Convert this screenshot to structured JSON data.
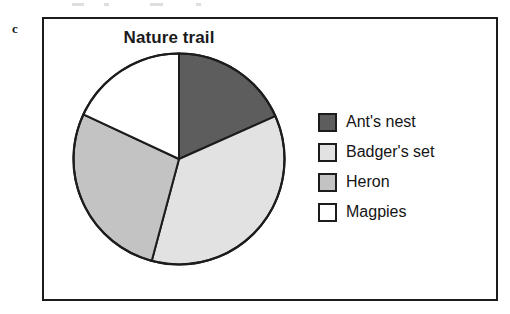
{
  "panel": {
    "letter": "c"
  },
  "chart_data": {
    "type": "pie",
    "title": "Nature trail",
    "xlabel": "",
    "ylabel": "",
    "legend_position": "right",
    "grid": false,
    "start_angle_deg": 0,
    "direction": "clockwise",
    "categories": [
      "Ant's nest",
      "Badger's set",
      "Heron",
      "Magpies"
    ],
    "values": [
      18,
      36,
      28,
      18
    ],
    "angles_deg": [
      66,
      129,
      100,
      65
    ],
    "colors": [
      "#5d5d5d",
      "#e2e2e2",
      "#c3c3c3",
      "#ffffff"
    ],
    "slice_edge_color": "#1c1c1c",
    "slices": [
      {
        "label": "Ant's nest",
        "value": 18,
        "angle_deg": 66,
        "color": "#5d5d5d"
      },
      {
        "label": "Badger's set",
        "value": 36,
        "angle_deg": 129,
        "color": "#e2e2e2"
      },
      {
        "label": "Heron",
        "value": 28,
        "angle_deg": 100,
        "color": "#c3c3c3"
      },
      {
        "label": "Magpies",
        "value": 18,
        "angle_deg": 65,
        "color": "#ffffff"
      }
    ]
  },
  "legend": {
    "items": [
      {
        "label": "Ant's nest",
        "color": "#5d5d5d"
      },
      {
        "label": "Badger's set",
        "color": "#e2e2e2"
      },
      {
        "label": "Heron",
        "color": "#c3c3c3"
      },
      {
        "label": "Magpies",
        "color": "#ffffff"
      }
    ]
  }
}
